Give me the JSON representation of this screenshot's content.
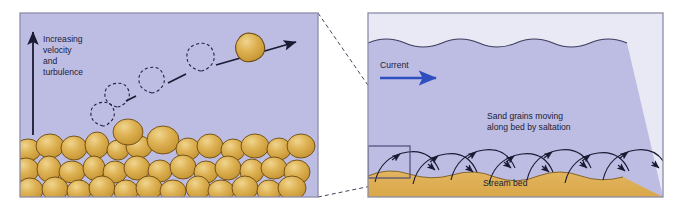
{
  "figure": {
    "panels": [
      {
        "id": "left-panel",
        "role": "close-up view of grain bouncing over the bed",
        "labels": {
          "axis_arrow_label_lines": [
            "Increasing",
            "velocity",
            "and",
            "turbulence"
          ],
          "axis_arrow_label": "Increasing velocity and turbulence"
        },
        "colors": {
          "water": "#bdbde4",
          "grain_fill": "#d9a93f",
          "grain_highlight": "#e8c878",
          "grain_outline": "#6b4a12",
          "line": "#1a1a33",
          "border": "#8d8da8"
        },
        "elements": {
          "vertical_arrow": "upward arrow showing increasing velocity and turbulence",
          "moving_grain": "solid sand grain at final position",
          "ghost_grains": "dashed outlines of the same grain at earlier bounce positions",
          "trajectory_arrow": "arrow showing grain path to the right",
          "bed": "packed bed of sand grains"
        }
      },
      {
        "id": "right-panel",
        "role": "wide view of stream with saltating grains",
        "labels": {
          "current": "Current",
          "saltation_lines": [
            "Sand grains moving",
            "along bed by saltation"
          ],
          "saltation": "Sand grains moving along bed by saltation",
          "stream_bed": "Stream bed"
        },
        "colors": {
          "air": "#e9e9f5",
          "water": "#bdbde4",
          "bed": "#dfae57",
          "current_arrow": "#2f4fbe",
          "line": "#1a1a33",
          "border": "#8d8da8",
          "inset_box": "#4a4a7a"
        },
        "elements": {
          "water_surface": "wavy water surface line",
          "current_arrow": "blue arrow pointing downstream to the right",
          "saltation_arcs": "series of hopping arc trajectories with arrowheads",
          "inset_box": "rectangle marking the region enlarged in the left panel",
          "bed": "undulating sand stream bed"
        }
      }
    ],
    "connectors": {
      "description": "dashed leader lines linking the inset box in the right panel to the enlarged left panel"
    }
  }
}
